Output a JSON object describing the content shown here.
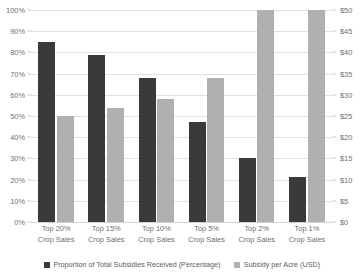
{
  "chart_data": {
    "type": "bar",
    "title": "",
    "subtitle": "",
    "xlabel": "",
    "ylabel": "",
    "categories": [
      "Top 20%\nCrop Sales",
      "Top 15%\nCrop Sales",
      "Top 10%\nCrop Sales",
      "Top 5%\nCrop Sales",
      "Top 2%\nCrop Sales",
      "Top 1%\nCrop Sales"
    ],
    "category_lines": [
      [
        "Top 20%",
        "Crop Sales"
      ],
      [
        "Top 15%",
        "Crop Sales"
      ],
      [
        "Top 10%",
        "Crop Sales"
      ],
      [
        "Top 5%",
        "Crop Sales"
      ],
      [
        "Top 2%",
        "Crop Sales"
      ],
      [
        "Top 1%",
        "Crop Sales"
      ]
    ],
    "series": [
      {
        "name": "Proportion of Total Subsidies Received (Percentage)",
        "axis": "left",
        "unit": "%",
        "color": "#3a3a3a",
        "values": [
          85,
          79,
          68,
          47,
          30,
          21
        ]
      },
      {
        "name": "Subsidy per Acre (USD)",
        "axis": "right",
        "unit": "$",
        "color": "#b0b0b0",
        "values": [
          25,
          27,
          29,
          34,
          50,
          50
        ]
      }
    ],
    "axes": {
      "left": {
        "label": "",
        "min": 0,
        "max": 100,
        "step": 10,
        "tick_labels": [
          "0%",
          "10%",
          "20%",
          "30%",
          "40%",
          "50%",
          "60%",
          "70%",
          "80%",
          "90%",
          "100%"
        ]
      },
      "right": {
        "label": "",
        "min": 0,
        "max": 50,
        "step": 5,
        "tick_labels": [
          "$0",
          "$5",
          "$10",
          "$15",
          "$20",
          "$25",
          "$30",
          "$35",
          "$40",
          "$45",
          "$50"
        ]
      }
    },
    "grid": true,
    "legend_position": "bottom",
    "legend": [
      {
        "label": "Proportion of Total Subsidies Received (Percentage)",
        "color": "#3a3a3a"
      },
      {
        "label": "Subsidy per Acre (USD)",
        "color": "#b0b0b0"
      }
    ]
  }
}
